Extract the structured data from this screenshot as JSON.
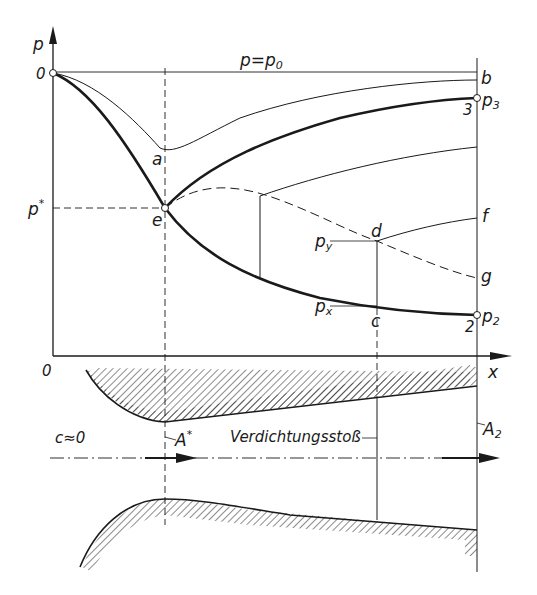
{
  "figure": {
    "axes": {
      "y_label": "p",
      "x_label": "x",
      "origin_label": "0",
      "start_point_label": "0",
      "p_star_label": "p",
      "p_star_sup": "*"
    },
    "lines": {
      "stagnation_label": "p=p",
      "stagnation_sub": "0"
    },
    "points": {
      "a": "a",
      "b": "b",
      "e": "e",
      "d": "d",
      "c": "c",
      "f": "f",
      "g": "g",
      "p3_main": "p",
      "p3_sub": "3",
      "p3_index": "3",
      "p2_main": "p",
      "p2_sub": "2",
      "p2_index": "2",
      "py_main": "p",
      "py_sub": "y",
      "px_main": "p",
      "px_sub": "x"
    },
    "nozzle": {
      "inlet_label": "c≈0",
      "throat_label": "A",
      "throat_sup": "*",
      "shock_label": "Verdichtungsstoß",
      "exit_label": "A",
      "exit_sub": "2"
    },
    "colors": {
      "ink": "#1a1a1a",
      "background": "#ffffff"
    }
  }
}
